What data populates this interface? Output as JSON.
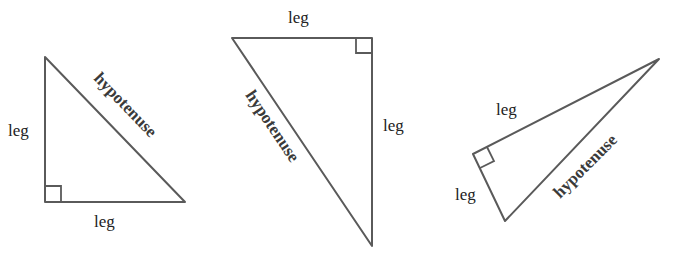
{
  "diagram": {
    "line_color": "#5a5a5a",
    "triangles": [
      {
        "id": "triangle-1",
        "right_angle_at": "bottom-left",
        "labels": {
          "leg_vertical": "leg",
          "leg_horizontal": "leg",
          "hypotenuse": "hypotenuse"
        }
      },
      {
        "id": "triangle-2",
        "right_angle_at": "top-right",
        "labels": {
          "leg_top": "leg",
          "leg_right": "leg",
          "hypotenuse": "hypotenuse"
        }
      },
      {
        "id": "triangle-3",
        "right_angle_at": "left",
        "labels": {
          "leg_upper": "leg",
          "leg_lower": "leg",
          "hypotenuse": "hypotenuse"
        }
      }
    ]
  }
}
